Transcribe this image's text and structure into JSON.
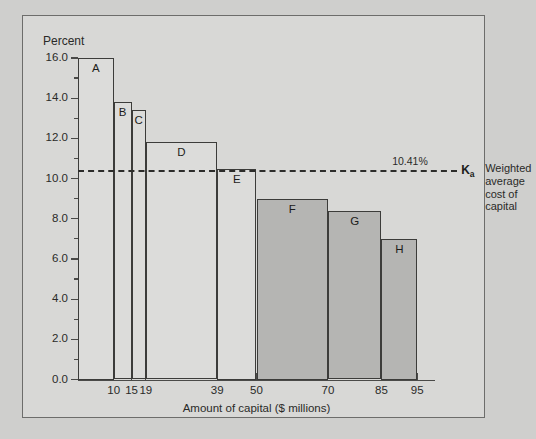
{
  "chart_data": {
    "type": "bar",
    "title": "",
    "ylabel": "Percent",
    "xlabel": "Amount of capital ($ millions)",
    "ylim": [
      0.0,
      16.0
    ],
    "ytick_labels": [
      "0.0",
      "2.0",
      "4.0",
      "6.0",
      "8.0",
      "10.0",
      "12.0",
      "14.0",
      "16.0"
    ],
    "ytick_values": [
      0.0,
      2.0,
      4.0,
      6.0,
      8.0,
      10.0,
      12.0,
      14.0,
      16.0
    ],
    "yminor_step": 1.0,
    "xtick_labels": [
      "10",
      "15",
      "19",
      "39",
      "50",
      "70",
      "85",
      "95"
    ],
    "xtick_values": [
      10,
      15,
      19,
      39,
      50,
      70,
      85,
      95
    ],
    "xlim": [
      0,
      100
    ],
    "grid": false,
    "legend_position": "right",
    "bars": [
      {
        "label": "A",
        "x_start": 0,
        "x_end": 10,
        "value": 16.0,
        "shade": "light"
      },
      {
        "label": "B",
        "x_start": 10,
        "x_end": 15,
        "value": 13.8,
        "shade": "light"
      },
      {
        "label": "C",
        "x_start": 15,
        "x_end": 19,
        "value": 13.4,
        "shade": "light"
      },
      {
        "label": "D",
        "x_start": 19,
        "x_end": 39,
        "value": 11.8,
        "shade": "light"
      },
      {
        "label": "E",
        "x_start": 39,
        "x_end": 50,
        "value": 10.5,
        "shade": "light"
      },
      {
        "label": "F",
        "x_start": 50,
        "x_end": 70,
        "value": 9.0,
        "shade": "dark"
      },
      {
        "label": "G",
        "x_start": 70,
        "x_end": 85,
        "value": 8.4,
        "shade": "dark"
      },
      {
        "label": "H",
        "x_start": 85,
        "x_end": 95,
        "value": 7.0,
        "shade": "dark"
      }
    ],
    "reference_line": {
      "value": 10.41,
      "value_label": "10.41%",
      "symbol": "K",
      "symbol_sub": "a",
      "legend_lines": [
        "Weighted",
        "average",
        "cost of",
        "capital"
      ]
    },
    "colors": {
      "background": "#d8d8d6",
      "page_background": "#cfcfcd",
      "bar_light": "#dcdcda",
      "bar_dark": "#b5b5b3",
      "bar_border": "#3c3c3a",
      "axis": "#4a4a48",
      "text": "#2a2a28",
      "frame_border": "#6d6d6b"
    }
  }
}
